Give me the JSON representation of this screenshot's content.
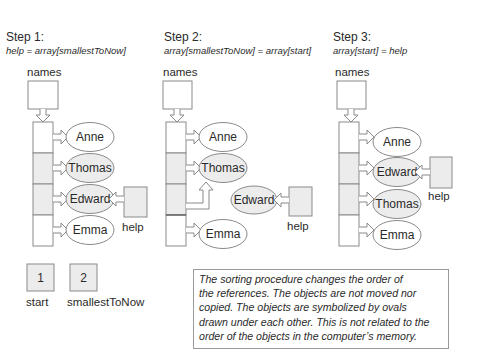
{
  "steps": [
    {
      "title": "Step 1:",
      "code": "help = array[smallestToNow]",
      "array_label": "names",
      "ovals": [
        "Anne",
        "Thomas",
        "Edward",
        "Emma"
      ],
      "help_label": "help",
      "help_target": "Edward"
    },
    {
      "title": "Step 2:",
      "code": "array[smallestToNow] = array[start]",
      "array_label": "names",
      "ovals": [
        "Anne",
        "Thomas",
        "Edward",
        "Emma"
      ],
      "help_label": "help",
      "help_target": "Edward"
    },
    {
      "title": "Step 3:",
      "code": "array[start] = help",
      "array_label": "names",
      "ovals": [
        "Anne",
        "Edward",
        "Thomas",
        "Emma"
      ],
      "help_label": "help",
      "help_target": "Edward"
    }
  ],
  "variables": [
    {
      "name": "start",
      "value": "1"
    },
    {
      "name": "smallestToNow",
      "value": "2"
    }
  ],
  "note": "The sorting procedure changes the order of\nthe references. The objects are not moved nor\ncopied. The objects are symbolized by ovals\ndrawn under each other. This is not related to the\norder of the objects in the computer’s memory.",
  "colors": {
    "outline": "#8a8a8a",
    "shaded": "#ececec",
    "text": "#2a2a2a"
  }
}
